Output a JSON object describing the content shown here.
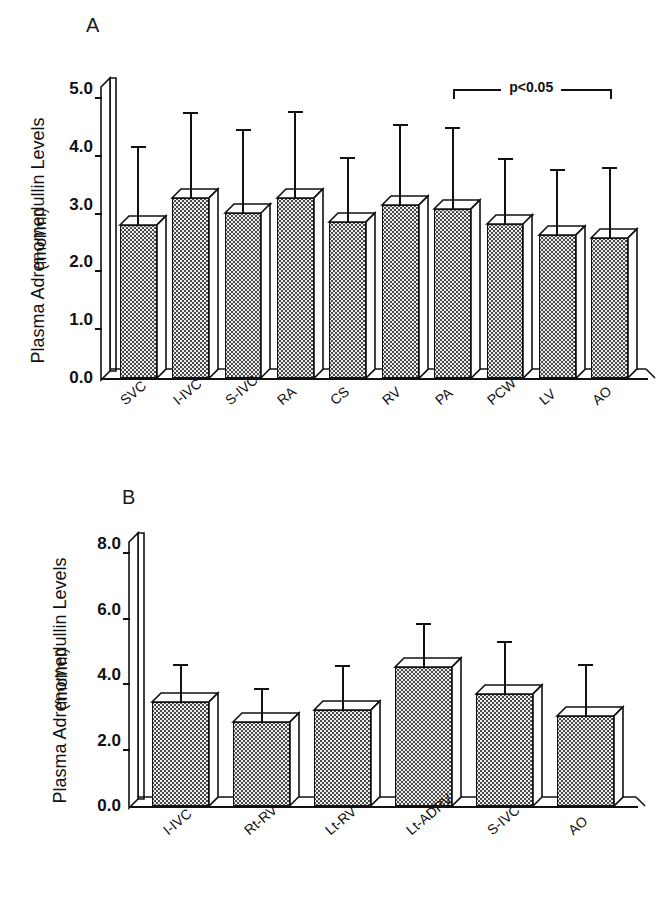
{
  "figure": {
    "ylabel": "Plasma Adrenomedullin Levels",
    "yunit": "(fmol/ml)"
  },
  "panels": [
    {
      "letter": "A"
    },
    {
      "letter": "B"
    }
  ],
  "chart_data": [
    {
      "type": "bar",
      "panel": "A",
      "title": "",
      "xlabel": "",
      "ylabel": "Plasma Adrenomedullin Levels (fmol/ml)",
      "ylim": [
        0.0,
        5.0
      ],
      "yticks": [
        0.0,
        1.0,
        2.0,
        3.0,
        4.0,
        5.0
      ],
      "ytick_labels": [
        "0.0",
        "1.0",
        "2.0",
        "3.0",
        "4.0",
        "5.0"
      ],
      "grid": false,
      "legend": "none",
      "errorbar_type": "upper-sd",
      "categories": [
        "SVC",
        "I-IVC",
        "S-IVC",
        "RA",
        "CS",
        "RV",
        "PA",
        "PCW",
        "LV",
        "AO"
      ],
      "values": [
        2.65,
        3.12,
        2.85,
        3.12,
        2.7,
        3.0,
        2.93,
        2.67,
        2.48,
        2.42
      ],
      "err_upper": [
        4.02,
        4.6,
        4.3,
        4.62,
        3.82,
        4.4,
        4.35,
        3.8,
        3.62,
        3.65
      ],
      "annotations": [
        {
          "text": "p<0.05",
          "from_category": "PA",
          "to_category": "AO",
          "y": 5.05
        }
      ]
    },
    {
      "type": "bar",
      "panel": "B",
      "title": "",
      "xlabel": "",
      "ylabel": "Plasma Adrenomedullin Levels (fmol/ml)",
      "ylim": [
        0.0,
        8.0
      ],
      "yticks": [
        0.0,
        2.0,
        4.0,
        6.0,
        8.0
      ],
      "ytick_labels": [
        "0.0",
        "2.0",
        "4.0",
        "6.0",
        "8.0"
      ],
      "grid": false,
      "legend": "none",
      "errorbar_type": "upper-sd",
      "categories": [
        "I-IVC",
        "Rt-RV",
        "Lt-RV",
        "Lt-ADRV",
        "S-IVC",
        "AO"
      ],
      "values": [
        3.18,
        2.55,
        2.92,
        4.25,
        3.42,
        2.75
      ],
      "err_upper": [
        4.35,
        3.6,
        4.3,
        5.6,
        5.05,
        4.35
      ],
      "annotations": []
    }
  ]
}
